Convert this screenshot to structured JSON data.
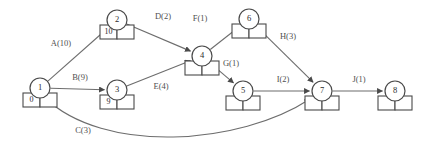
{
  "diagram": {
    "kind": "activity-on-edge-network",
    "colors": {
      "background": "#ffffff",
      "stroke": "#4a4a4a",
      "edge": "#6d6d6d",
      "text": "#2b2b2b",
      "label": "#4f4f4f"
    },
    "nodes": [
      {
        "id": "1",
        "cx": 40,
        "cy": 88,
        "r": 10,
        "cells": [
          "0",
          ""
        ]
      },
      {
        "id": "2",
        "cx": 117,
        "cy": 20,
        "r": 10,
        "cells": [
          "10",
          ""
        ]
      },
      {
        "id": "3",
        "cx": 117,
        "cy": 90,
        "r": 10,
        "cells": [
          "9",
          ""
        ]
      },
      {
        "id": "4",
        "cx": 202,
        "cy": 56,
        "r": 10,
        "cells": [
          "",
          ""
        ]
      },
      {
        "id": "5",
        "cx": 243,
        "cy": 91,
        "r": 10,
        "cells": [
          "",
          ""
        ]
      },
      {
        "id": "6",
        "cx": 249,
        "cy": 19,
        "r": 10,
        "cells": [
          "",
          ""
        ]
      },
      {
        "id": "7",
        "cx": 322,
        "cy": 91,
        "r": 10,
        "cells": [
          "",
          ""
        ]
      },
      {
        "id": "8",
        "cx": 395,
        "cy": 91,
        "r": 10,
        "cells": [
          "",
          ""
        ]
      }
    ],
    "edges": [
      {
        "name": "A",
        "weight": "10",
        "label": "A(10)",
        "from": "1",
        "to": "2",
        "label_x": 61,
        "label_y": 44
      },
      {
        "name": "B",
        "weight": "9",
        "label": "B(9)",
        "from": "1",
        "to": "3",
        "label_x": 80,
        "label_y": 78
      },
      {
        "name": "C",
        "weight": "3",
        "label": "C(3)",
        "from": "1",
        "to": "7",
        "label_x": 83,
        "label_y": 131,
        "curved": true
      },
      {
        "name": "D",
        "weight": "2",
        "label": "D(2)",
        "from": "2",
        "to": "4",
        "label_x": 163,
        "label_y": 17
      },
      {
        "name": "E",
        "weight": "4",
        "label": "E(4)",
        "from": "3",
        "to": "4",
        "label_x": 161,
        "label_y": 87
      },
      {
        "name": "F",
        "weight": "1",
        "label": "F(1)",
        "from": "4",
        "to": "6",
        "label_x": 200,
        "label_y": 19
      },
      {
        "name": "G",
        "weight": "1",
        "label": "G(1)",
        "from": "4",
        "to": "5",
        "label_x": 231,
        "label_y": 64
      },
      {
        "name": "H",
        "weight": "3",
        "label": "H(3)",
        "from": "6",
        "to": "7",
        "label_x": 288,
        "label_y": 37
      },
      {
        "name": "I",
        "weight": "2",
        "label": "I(2)",
        "from": "5",
        "to": "7",
        "label_x": 283,
        "label_y": 80
      },
      {
        "name": "J",
        "weight": "1",
        "label": "J(1)",
        "from": "7",
        "to": "8",
        "label_x": 359,
        "label_y": 80
      }
    ]
  }
}
